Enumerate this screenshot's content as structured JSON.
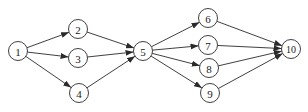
{
  "diagram": {
    "type": "directed-graph",
    "node_radius": 9.5,
    "colors": {
      "stroke": "#2a2a2a",
      "fill": "#ffffff",
      "text": "#222222"
    },
    "nodes": [
      {
        "id": "1",
        "label": "1",
        "x": 18,
        "y": 51
      },
      {
        "id": "2",
        "label": "2",
        "x": 78,
        "y": 29
      },
      {
        "id": "3",
        "label": "3",
        "x": 78,
        "y": 58
      },
      {
        "id": "4",
        "label": "4",
        "x": 79,
        "y": 93
      },
      {
        "id": "5",
        "label": "5",
        "x": 143,
        "y": 51
      },
      {
        "id": "6",
        "label": "6",
        "x": 208,
        "y": 18
      },
      {
        "id": "7",
        "label": "7",
        "x": 208,
        "y": 45
      },
      {
        "id": "8",
        "label": "8",
        "x": 209,
        "y": 68
      },
      {
        "id": "9",
        "label": "9",
        "x": 210,
        "y": 93
      },
      {
        "id": "10",
        "label": "10",
        "x": 291,
        "y": 49
      }
    ],
    "edges": [
      {
        "from": "1",
        "to": "2"
      },
      {
        "from": "1",
        "to": "3"
      },
      {
        "from": "1",
        "to": "4"
      },
      {
        "from": "2",
        "to": "5"
      },
      {
        "from": "3",
        "to": "5"
      },
      {
        "from": "4",
        "to": "5"
      },
      {
        "from": "5",
        "to": "6"
      },
      {
        "from": "5",
        "to": "7"
      },
      {
        "from": "5",
        "to": "8"
      },
      {
        "from": "5",
        "to": "9"
      },
      {
        "from": "6",
        "to": "10"
      },
      {
        "from": "7",
        "to": "10"
      },
      {
        "from": "8",
        "to": "10"
      },
      {
        "from": "9",
        "to": "10"
      }
    ]
  }
}
